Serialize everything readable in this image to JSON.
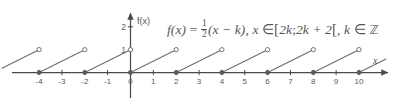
{
  "figure": {
    "title_text": "",
    "formula": {
      "lhs": "f",
      "lhs_arg": "(x)",
      "equals": "=",
      "fraction_numerator": "1",
      "fraction_denominator": "2",
      "factor": "(x − k)",
      "comma1": ",",
      "domain_var": "x",
      "member": "∈",
      "bracket_open": "[",
      "interval_lo": "2k",
      "interval_sep": ";",
      "interval_hi": "2k + 2",
      "bracket_close": "[",
      "comma2": ",",
      "index_var": "k",
      "member2": "∈",
      "index_set": "ℤ",
      "plain": "f(x) = 1/2(x − k), x ∈ [2k;2k + 2[, k ∈ ℤ"
    },
    "axis": {
      "y_axis_name": "f(x)",
      "x_axis_name": "x",
      "x_tick_labels": [
        "-4",
        "-3",
        "-2",
        "-1",
        "0",
        "1",
        "2",
        "3",
        "4",
        "5",
        "6",
        "7",
        "8",
        "9",
        "10"
      ],
      "y_tick_labels": [
        "1",
        "2"
      ],
      "x_min": -4.9,
      "x_max": 11.2,
      "y_min": -1.4,
      "y_max": 2.7,
      "grid": false,
      "legend": "none"
    },
    "colors": {
      "background": "#ffffff",
      "axis": "#4a4a4a",
      "curve": "#6e6e6e",
      "marker_fill": "#5a5a5a",
      "marker_open": "#ffffff",
      "text": "#545454"
    }
  },
  "chart_data": {
    "type": "line",
    "xlabel": "x",
    "ylabel": "f(x)",
    "xlim": [
      -4.9,
      11.2
    ],
    "ylim": [
      -1.4,
      2.7
    ],
    "grid": false,
    "legend_position": "none",
    "xticks": [
      -4,
      -3,
      -2,
      -1,
      0,
      1,
      2,
      3,
      4,
      5,
      6,
      7,
      8,
      9,
      10
    ],
    "yticks": [
      1,
      2
    ],
    "slope": 0.5,
    "period": 2,
    "segments": [
      {
        "k": -3,
        "x_start": -6,
        "y_start": 0,
        "x_end": -4,
        "y_end": 1,
        "start_marker": "closed",
        "end_marker": "open",
        "clipped_left": true
      },
      {
        "k": -2,
        "x_start": -4,
        "y_start": 0,
        "x_end": -2,
        "y_end": 1,
        "start_marker": "closed",
        "end_marker": "open",
        "clipped_left": false
      },
      {
        "k": -1,
        "x_start": -2,
        "y_start": 0,
        "x_end": 0,
        "y_end": 1,
        "start_marker": "closed",
        "end_marker": "open",
        "clipped_left": false
      },
      {
        "k": 0,
        "x_start": 0,
        "y_start": 0,
        "x_end": 2,
        "y_end": 1,
        "start_marker": "closed",
        "end_marker": "open",
        "clipped_left": false
      },
      {
        "k": 1,
        "x_start": 2,
        "y_start": 0,
        "x_end": 4,
        "y_end": 1,
        "start_marker": "closed",
        "end_marker": "open",
        "clipped_left": false
      },
      {
        "k": 2,
        "x_start": 4,
        "y_start": 0,
        "x_end": 6,
        "y_end": 1,
        "start_marker": "closed",
        "end_marker": "open",
        "clipped_left": false
      },
      {
        "k": 3,
        "x_start": 6,
        "y_start": 0,
        "x_end": 8,
        "y_end": 1,
        "start_marker": "closed",
        "end_marker": "open",
        "clipped_left": false
      },
      {
        "k": 4,
        "x_start": 8,
        "y_start": 0,
        "x_end": 10,
        "y_end": 1,
        "start_marker": "closed",
        "end_marker": "open",
        "clipped_left": false
      },
      {
        "k": 5,
        "x_start": 10,
        "y_start": 0,
        "x_end": 11.2,
        "y_end": 0.6,
        "start_marker": "closed",
        "end_marker": "none",
        "clipped_right": true
      }
    ]
  }
}
